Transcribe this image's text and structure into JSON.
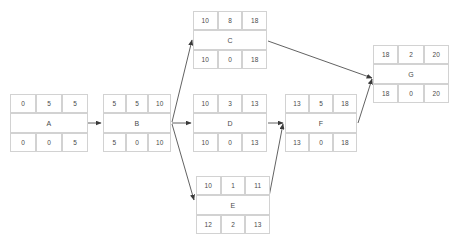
{
  "diagram": {
    "type": "pert-cpm-network",
    "cell_headers": {
      "top": [
        "early-start",
        "duration",
        "early-finish"
      ],
      "bottom": [
        "late-start",
        "slack",
        "late-finish"
      ]
    },
    "nodes": [
      {
        "id": "A",
        "label": "A",
        "es": "0",
        "dur": "5",
        "ef": "5",
        "ls": "0",
        "slack": "0",
        "lf": "5",
        "x": 10,
        "y": 94,
        "w": 78,
        "h": 58
      },
      {
        "id": "B",
        "label": "B",
        "es": "5",
        "dur": "5",
        "ef": "10",
        "ls": "5",
        "slack": "0",
        "lf": "10",
        "x": 103,
        "y": 94,
        "w": 68,
        "h": 58
      },
      {
        "id": "C",
        "label": "C",
        "es": "10",
        "dur": "8",
        "ef": "18",
        "ls": "10",
        "slack": "0",
        "lf": "18",
        "x": 193,
        "y": 11,
        "w": 74,
        "h": 58
      },
      {
        "id": "D",
        "label": "D",
        "es": "10",
        "dur": "3",
        "ef": "13",
        "ls": "10",
        "slack": "0",
        "lf": "13",
        "x": 193,
        "y": 94,
        "w": 74,
        "h": 58
      },
      {
        "id": "E",
        "label": "E",
        "es": "10",
        "dur": "1",
        "ef": "11",
        "ls": "12",
        "slack": "2",
        "lf": "13",
        "x": 196,
        "y": 176,
        "w": 74,
        "h": 58
      },
      {
        "id": "F",
        "label": "F",
        "es": "13",
        "dur": "5",
        "ef": "18",
        "ls": "13",
        "slack": "0",
        "lf": "18",
        "x": 285,
        "y": 94,
        "w": 72,
        "h": 58
      },
      {
        "id": "G",
        "label": "G",
        "es": "18",
        "dur": "2",
        "ef": "20",
        "ls": "18",
        "slack": "0",
        "lf": "20",
        "x": 373,
        "y": 45,
        "w": 76,
        "h": 58
      }
    ],
    "edges": [
      {
        "from": "A",
        "to": "B",
        "x1": 88,
        "y1": 123,
        "x2": 101,
        "y2": 123
      },
      {
        "from": "B",
        "to": "C",
        "x1": 172,
        "y1": 122,
        "x2": 192,
        "y2": 40
      },
      {
        "from": "B",
        "to": "D",
        "x1": 172,
        "y1": 123,
        "x2": 191,
        "y2": 123
      },
      {
        "from": "B",
        "to": "E",
        "x1": 172,
        "y1": 124,
        "x2": 194,
        "y2": 200
      },
      {
        "from": "C",
        "to": "G",
        "x1": 268,
        "y1": 41,
        "x2": 372,
        "y2": 78
      },
      {
        "from": "D",
        "to": "F",
        "x1": 268,
        "y1": 123,
        "x2": 283,
        "y2": 123
      },
      {
        "from": "E",
        "to": "F",
        "x1": 268,
        "y1": 202,
        "x2": 283,
        "y2": 124
      },
      {
        "from": "F",
        "to": "G",
        "x1": 358,
        "y1": 123,
        "x2": 372,
        "y2": 79
      }
    ],
    "style": {
      "edge_color": "#3a3a3a",
      "border_color": "#d2d2d2",
      "text_color": "#4a4a4a",
      "background": "#ffffff"
    }
  }
}
